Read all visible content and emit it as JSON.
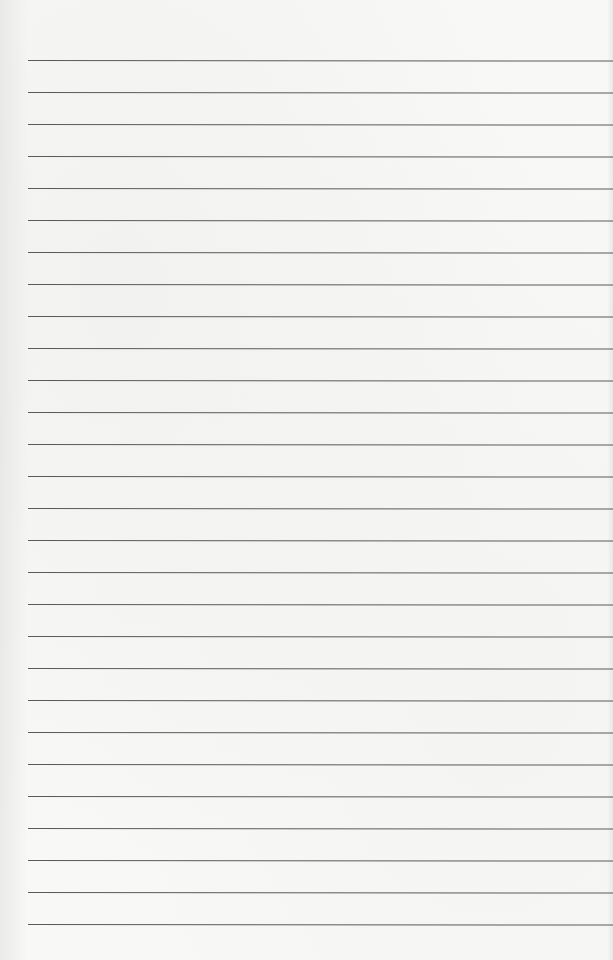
{
  "document": {
    "type": "lined-paper",
    "background_color": "#f8f8f7",
    "line_color": "#5a5a5a",
    "line_count": 28,
    "first_line_y": 60,
    "line_spacing": 32,
    "line_left_margin": 28,
    "text": ""
  }
}
